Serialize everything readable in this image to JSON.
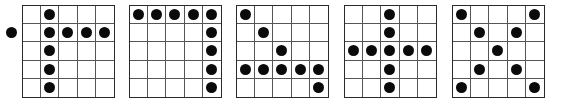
{
  "figure": {
    "grid_size": 5,
    "dot_color": "#0a0a0a",
    "line_color": "#555555",
    "panels": [
      {
        "id": "panel-1",
        "left": 22,
        "dots": [
          [
            0,
            1
          ],
          [
            1,
            1
          ],
          [
            1,
            2
          ],
          [
            1,
            3
          ],
          [
            1,
            4
          ],
          [
            2,
            1
          ],
          [
            3,
            1
          ],
          [
            4,
            1
          ]
        ],
        "outside_dots": [
          {
            "row": 1,
            "side": "left"
          }
        ]
      },
      {
        "id": "panel-2",
        "left": 129,
        "dots": [
          [
            0,
            0
          ],
          [
            0,
            1
          ],
          [
            0,
            2
          ],
          [
            0,
            3
          ],
          [
            0,
            4
          ],
          [
            1,
            4
          ],
          [
            2,
            4
          ],
          [
            3,
            4
          ],
          [
            4,
            4
          ]
        ],
        "outside_dots": []
      },
      {
        "id": "panel-3",
        "left": 236,
        "dots": [
          [
            0,
            0
          ],
          [
            1,
            1
          ],
          [
            2,
            2
          ],
          [
            3,
            0
          ],
          [
            3,
            1
          ],
          [
            3,
            2
          ],
          [
            3,
            3
          ],
          [
            3,
            4
          ],
          [
            4,
            4
          ]
        ],
        "outside_dots": []
      },
      {
        "id": "panel-4",
        "left": 344,
        "dots": [
          [
            0,
            2
          ],
          [
            1,
            2
          ],
          [
            2,
            0
          ],
          [
            2,
            1
          ],
          [
            2,
            2
          ],
          [
            2,
            3
          ],
          [
            2,
            4
          ],
          [
            3,
            2
          ],
          [
            4,
            2
          ]
        ],
        "outside_dots": []
      },
      {
        "id": "panel-5",
        "left": 452,
        "dots": [
          [
            0,
            0
          ],
          [
            0,
            4
          ],
          [
            1,
            1
          ],
          [
            1,
            3
          ],
          [
            2,
            2
          ],
          [
            3,
            1
          ],
          [
            3,
            3
          ],
          [
            4,
            0
          ],
          [
            4,
            4
          ]
        ],
        "outside_dots": []
      }
    ]
  }
}
